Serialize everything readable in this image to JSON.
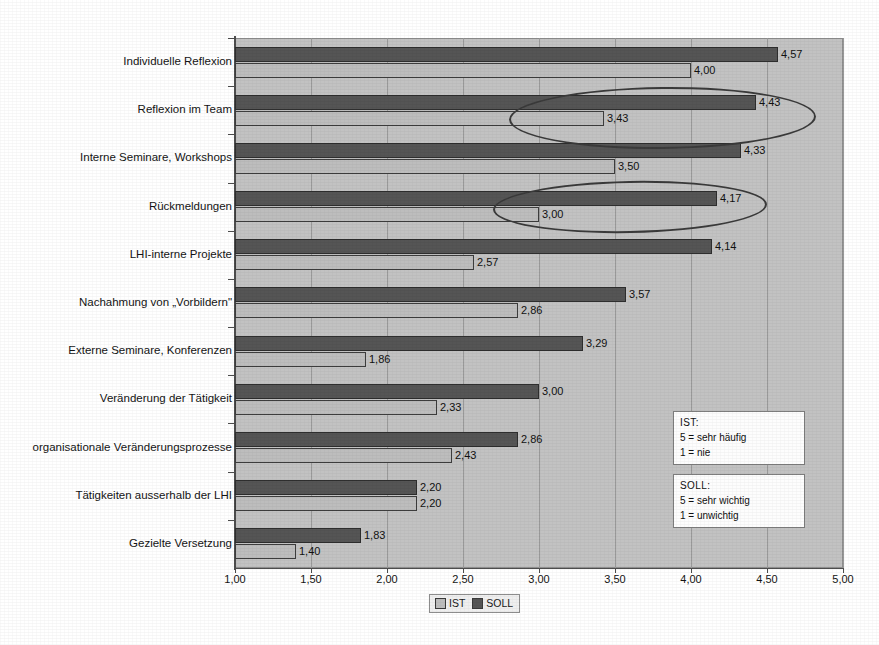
{
  "chart_data": {
    "type": "bar",
    "orientation": "horizontal",
    "title": "",
    "xlabel": "",
    "ylabel": "",
    "xlim": [
      1.0,
      5.0
    ],
    "xticks": [
      "1,00",
      "1,50",
      "2,00",
      "2,50",
      "3,00",
      "3,50",
      "4,00",
      "4,50",
      "5,00"
    ],
    "grid": true,
    "legend_position": "bottom",
    "decimal_separator": ",",
    "categories": [
      "Individuelle Reflexion",
      "Reflexion im Team",
      "Interne Seminare, Workshops",
      "Rückmeldungen",
      "LHI-interne Projekte",
      "Nachahmung von „Vorbildern\"",
      "Externe Seminare, Konferenzen",
      "Veränderung der Tätigkeit",
      "organisationale Veränderungsprozesse",
      "Tätigkeiten ausserhalb der LHI",
      "Gezielte Versetzung"
    ],
    "series": [
      {
        "name": "SOLL",
        "color": "#555555",
        "values": [
          4.57,
          4.43,
          4.33,
          4.17,
          4.14,
          3.57,
          3.29,
          3.0,
          2.86,
          2.2,
          1.83
        ],
        "labels": [
          "4,57",
          "4,43",
          "4,33",
          "4,17",
          "4,14",
          "3,57",
          "3,29",
          "3,00",
          "2,86",
          "2,20",
          "1,83"
        ]
      },
      {
        "name": "IST",
        "color": "#bdbdbd",
        "values": [
          4.0,
          3.43,
          3.5,
          3.0,
          2.57,
          2.86,
          1.86,
          2.33,
          2.43,
          2.2,
          1.4
        ],
        "labels": [
          "4,00",
          "3,43",
          "3,50",
          "3,00",
          "2,57",
          "2,86",
          "1,86",
          "2,33",
          "2,43",
          "2,20",
          "1,40"
        ]
      }
    ],
    "annotations": [
      {
        "name": "highlight-ellipse-reflexion-im-team",
        "shape": "ellipse",
        "target": "Reflexion im Team"
      },
      {
        "name": "highlight-ellipse-rueckmeldungen",
        "shape": "ellipse",
        "target": "Rückmeldungen"
      }
    ]
  },
  "legend": {
    "entries": [
      {
        "label": "IST",
        "color": "#bdbdbd"
      },
      {
        "label": "SOLL",
        "color": "#555555"
      }
    ]
  },
  "notes": {
    "ist": {
      "title": "IST:",
      "line_high": "5 = sehr häufig",
      "line_low": "1 = nie"
    },
    "soll": {
      "title": "SOLL:",
      "line_high": "5 = sehr wichtig",
      "line_low": "1 = unwichtig"
    }
  }
}
